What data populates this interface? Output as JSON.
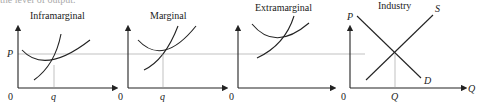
{
  "cut_text": "the level of output.",
  "panels": [
    {
      "title": "Inframarginal",
      "x_tick": "q",
      "origin": "0",
      "y_label": "P"
    },
    {
      "title": "Marginal",
      "x_tick": "q",
      "origin": "0"
    },
    {
      "title": "Extramarginal",
      "origin": "0"
    },
    {
      "title": "Industry",
      "x_tick": "Q",
      "origin": "0",
      "y_label": "P",
      "x_label": "Q",
      "supply_label": "S",
      "demand_label": "D"
    }
  ]
}
